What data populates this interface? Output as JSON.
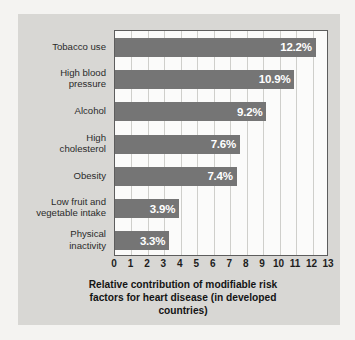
{
  "chart_data": {
    "type": "bar",
    "orientation": "horizontal",
    "title_lines": [
      "Relative contribution of modifiable risk",
      "factors for heart disease (in developed",
      "countries)"
    ],
    "categories": [
      "Tobacco use",
      "High blood\npressure",
      "Alcohol",
      "High\ncholesterol",
      "Obesity",
      "Low fruit and\nvegetable intake",
      "Physical\ninactivity"
    ],
    "values": [
      12.2,
      10.9,
      9.2,
      7.6,
      7.4,
      3.9,
      3.3
    ],
    "value_labels": [
      "12.2%",
      "10.9%",
      "9.2%",
      "7.6%",
      "7.4%",
      "3.9%",
      "3.3%"
    ],
    "xlabel": "",
    "ylabel": "",
    "xlim": [
      0,
      13
    ],
    "xticks": [
      0,
      1,
      2,
      3,
      4,
      5,
      6,
      7,
      8,
      9,
      10,
      11,
      12,
      13
    ],
    "xtick_labels": [
      "0",
      "1",
      "2",
      "3",
      "4",
      "5",
      "6",
      "7",
      "8",
      "9",
      "10",
      "11",
      "12",
      "13"
    ],
    "grid": "vertical",
    "legend": "none",
    "colors": {
      "bar": "#757575",
      "value_text": "#ffffff",
      "plot_background": "#fbfbfa",
      "panel_background": "#d8d7d4",
      "page_background": "#f4f3f1",
      "axis_border": "#5d5d5d",
      "gridline": "#cfcfcb",
      "label_text": "#2b2b2b",
      "caption_text": "#141414"
    }
  }
}
